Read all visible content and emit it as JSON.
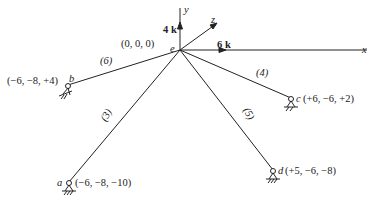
{
  "diagram": {
    "type": "space-truss",
    "origin": {
      "node": "e",
      "coords": "(0, 0, 0)"
    },
    "axes": {
      "x": "x",
      "y": "y",
      "z": "z"
    },
    "loads": [
      {
        "label": "4 k",
        "direction": "y"
      },
      {
        "label": "6 k",
        "direction": "x"
      }
    ],
    "nodes": {
      "a": {
        "name": "a",
        "coords": "(−6, −8, −10)"
      },
      "b": {
        "name": "b",
        "coords": "(−6, −8, +4)"
      },
      "c": {
        "name": "c",
        "coords": "(+6, −6, +2)"
      },
      "d": {
        "name": "d",
        "coords": "(+5, −6, −8)"
      },
      "e": {
        "name": "e"
      }
    },
    "members": [
      {
        "label": "(6)",
        "from": "e",
        "to": "b"
      },
      {
        "label": "(4)",
        "from": "e",
        "to": "c"
      },
      {
        "label": "(3)",
        "from": "e",
        "to": "a"
      },
      {
        "label": "(5)",
        "from": "e",
        "to": "d"
      }
    ],
    "colors": {
      "line": "#222222",
      "background": "#ffffff"
    }
  }
}
